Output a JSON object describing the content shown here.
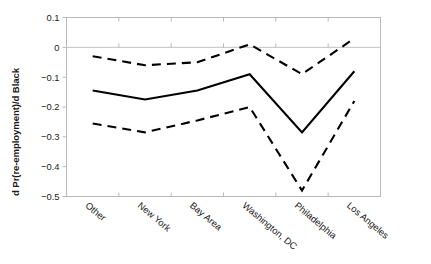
{
  "chart_data": {
    "type": "line",
    "title": "",
    "xlabel": "",
    "ylabel": "d Pr(re-employment)/d Black",
    "categories": [
      "Other",
      "New York",
      "Bay Area",
      "Washington, DC",
      "Philadelphia",
      "Los Angeles"
    ],
    "ylim": [
      -0.5,
      0.1
    ],
    "yticks": [
      0.1,
      0,
      -0.1,
      -0.2,
      -0.3,
      -0.4,
      -0.5
    ],
    "ytick_labels": [
      "0.1",
      "0",
      "−0.1",
      "−0.2",
      "−0.3",
      "−0.4",
      "−0.5"
    ],
    "grid": false,
    "zero_reference_line": true,
    "legend": "none",
    "series": [
      {
        "name": "upper confidence bound",
        "style": "dashed",
        "values": [
          -0.03,
          -0.06,
          -0.05,
          0.01,
          -0.09,
          0.03
        ]
      },
      {
        "name": "point estimate",
        "style": "solid",
        "values": [
          -0.145,
          -0.175,
          -0.145,
          -0.09,
          -0.285,
          -0.08
        ]
      },
      {
        "name": "lower confidence bound",
        "style": "dashed",
        "values": [
          -0.255,
          -0.285,
          -0.245,
          -0.2,
          -0.48,
          -0.18
        ]
      }
    ],
    "colors": {
      "line": "#000000",
      "frame": "#b9b9b9",
      "zero_line": "#c2c2c2",
      "background": "#ffffff",
      "text": "#1a1a1a"
    }
  }
}
